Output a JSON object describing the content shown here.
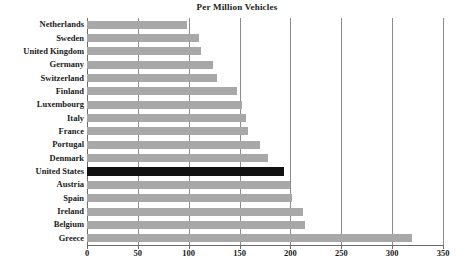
{
  "chart_data": {
    "type": "bar",
    "orientation": "horizontal",
    "title": "Per Million Vehicles",
    "xlabel": "",
    "ylabel": "",
    "xlim": [
      0,
      350
    ],
    "xticks": [
      0,
      50,
      100,
      150,
      200,
      250,
      300,
      350
    ],
    "grid": true,
    "legend": "none",
    "categories": [
      "Netherlands",
      "Sweden",
      "United Kingdom",
      "Germany",
      "Switzerland",
      "Finland",
      "Luxembourg",
      "Italy",
      "France",
      "Portugal",
      "Denmark",
      "United States",
      "Austria",
      "Spain",
      "Ireland",
      "Belgium",
      "Greece"
    ],
    "values": [
      98,
      110,
      112,
      124,
      128,
      147,
      152,
      156,
      158,
      170,
      178,
      194,
      200,
      202,
      212,
      214,
      320
    ],
    "highlight_category": "United States",
    "colors": {
      "bar": "#a8a8a8",
      "highlight_bar": "#111111",
      "gridline": "#8c8c8c",
      "axis": "#6b6b6b",
      "text": "#1a1a1a",
      "background": "#ffffff"
    }
  }
}
